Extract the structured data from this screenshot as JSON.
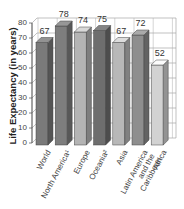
{
  "chart_data": {
    "type": "bar",
    "title": "",
    "xlabel": "",
    "ylabel": "Life Expectancy (in years)",
    "ylim": [
      0,
      80
    ],
    "yticks": [
      0,
      10,
      20,
      30,
      40,
      50,
      60,
      70,
      80
    ],
    "grid": true,
    "style": "3d",
    "categories": [
      "World",
      "North America¹",
      "Europe",
      "Oceania²",
      "Asia",
      "Latin America and the Caribbean",
      "Africa"
    ],
    "values": [
      67,
      78,
      74,
      75,
      67,
      72,
      52
    ],
    "category_labels_display": [
      "World",
      "North America¹",
      "Europe",
      "Oceania²",
      "Asia",
      "Latin America\nand the\nCaribbean",
      "Africa"
    ],
    "bar_colors": [
      "#7a7a7a",
      "#7e7e7e",
      "#b4b4b4",
      "#6e6e6e",
      "#b8b8b8",
      "#8e8e8e",
      "#d2d2d2"
    ]
  },
  "labels": {
    "ylabel": "Life Expectancy (in years)",
    "yticks": [
      "0",
      "10",
      "20",
      "30",
      "40",
      "50",
      "60",
      "70",
      "80"
    ],
    "values": [
      "67",
      "78",
      "74",
      "75",
      "67",
      "72",
      "52"
    ],
    "categories": [
      "World",
      "North America¹",
      "Europe",
      "Oceania²",
      "Asia",
      "Latin America\nand the\nCaribbean",
      "Africa"
    ]
  }
}
